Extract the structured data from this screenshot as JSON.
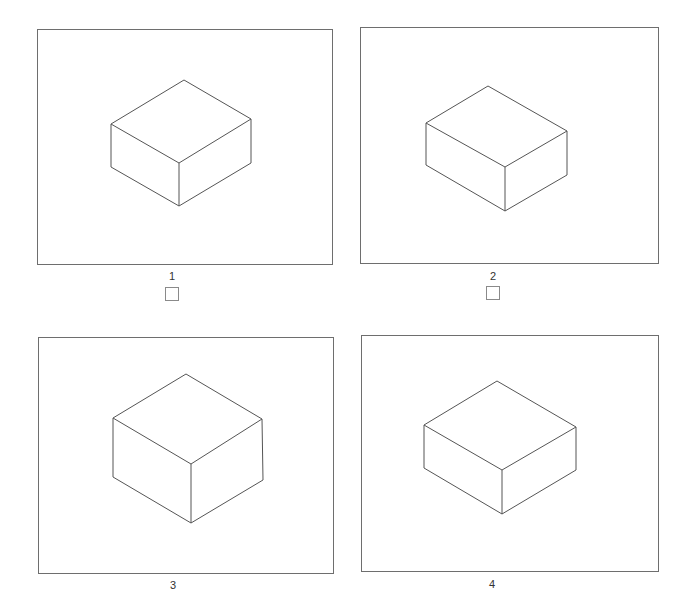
{
  "options": [
    {
      "label": "1",
      "has_checkbox": true,
      "checked": false
    },
    {
      "label": "2",
      "has_checkbox": true,
      "checked": false
    },
    {
      "label": "3",
      "has_checkbox": false
    },
    {
      "label": "4",
      "has_checkbox": false
    }
  ],
  "colors": {
    "line": "#555555",
    "frame": "#6e6e6e",
    "background": "#ffffff"
  }
}
